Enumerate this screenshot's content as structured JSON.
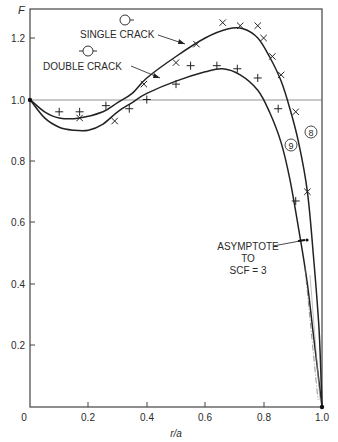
{
  "chart_data": {
    "type": "line",
    "title": "",
    "xlabel": "r/a",
    "ylabel": "F",
    "xlim": [
      0,
      1.0
    ],
    "ylim": [
      0,
      1.3
    ],
    "xticks": [
      "0",
      "0.2",
      "0.4",
      "0.6",
      "0.8",
      "1.0"
    ],
    "yticks": [
      "0",
      "0.2",
      "0.4",
      "0.6",
      "0.8",
      "1.0",
      "1.2"
    ],
    "reference_line": {
      "y": 1.0
    },
    "grid": false,
    "series": [
      {
        "name": "SINGLE CRACK",
        "curve_label": "8",
        "marker": "x",
        "curve": [
          [
            0,
            1.0
          ],
          [
            0.05,
            0.96
          ],
          [
            0.1,
            0.94
          ],
          [
            0.17,
            0.94
          ],
          [
            0.25,
            0.96
          ],
          [
            0.3,
            0.99
          ],
          [
            0.35,
            1.02
          ],
          [
            0.4,
            1.07
          ],
          [
            0.5,
            1.14
          ],
          [
            0.6,
            1.2
          ],
          [
            0.68,
            1.23
          ],
          [
            0.73,
            1.23
          ],
          [
            0.78,
            1.2
          ],
          [
            0.82,
            1.14
          ],
          [
            0.86,
            1.06
          ],
          [
            0.89,
            0.97
          ],
          [
            0.92,
            0.86
          ],
          [
            0.95,
            0.7
          ],
          [
            0.97,
            0.5
          ],
          [
            0.99,
            0.25
          ],
          [
            1.0,
            0.0
          ]
        ],
        "points": [
          [
            0.17,
            0.94
          ],
          [
            0.29,
            0.93
          ],
          [
            0.39,
            1.05
          ],
          [
            0.5,
            1.12
          ],
          [
            0.57,
            1.18
          ],
          [
            0.66,
            1.25
          ],
          [
            0.72,
            1.24
          ],
          [
            0.78,
            1.24
          ],
          [
            0.8,
            1.2
          ],
          [
            0.83,
            1.14
          ],
          [
            0.86,
            1.08
          ],
          [
            0.91,
            0.96
          ],
          [
            0.95,
            0.7
          ]
        ]
      },
      {
        "name": "DOUBLE CRACK",
        "curve_label": "9",
        "marker": "+",
        "curve": [
          [
            0,
            1.0
          ],
          [
            0.05,
            0.94
          ],
          [
            0.1,
            0.91
          ],
          [
            0.15,
            0.9
          ],
          [
            0.2,
            0.9
          ],
          [
            0.25,
            0.92
          ],
          [
            0.3,
            0.96
          ],
          [
            0.35,
            0.99
          ],
          [
            0.4,
            1.02
          ],
          [
            0.5,
            1.06
          ],
          [
            0.6,
            1.09
          ],
          [
            0.66,
            1.1
          ],
          [
            0.72,
            1.08
          ],
          [
            0.78,
            1.03
          ],
          [
            0.82,
            0.96
          ],
          [
            0.86,
            0.86
          ],
          [
            0.89,
            0.74
          ],
          [
            0.92,
            0.58
          ],
          [
            0.95,
            0.4
          ],
          [
            0.97,
            0.24
          ],
          [
            1.0,
            0.0
          ]
        ],
        "points": [
          [
            0.1,
            0.96
          ],
          [
            0.17,
            0.96
          ],
          [
            0.26,
            0.98
          ],
          [
            0.34,
            0.97
          ],
          [
            0.4,
            1.0
          ],
          [
            0.5,
            1.05
          ],
          [
            0.55,
            1.11
          ],
          [
            0.64,
            1.11
          ],
          [
            0.71,
            1.1
          ],
          [
            0.78,
            1.07
          ],
          [
            0.85,
            0.97
          ],
          [
            0.91,
            0.67
          ]
        ]
      }
    ],
    "annotations": [
      {
        "text": "SINGLE CRACK",
        "arrow_to": [
          0.57,
          1.16
        ]
      },
      {
        "text": "DOUBLE CRACK",
        "arrow_to": [
          0.48,
          1.06
        ]
      },
      {
        "text": "ASYMPTOTE TO SCF = 3",
        "arrow_to": [
          0.93,
          0.5
        ]
      },
      {
        "text": "8",
        "circled": true,
        "at": [
          0.945,
          0.9
        ]
      },
      {
        "text": "9",
        "circled": true,
        "at": [
          0.9,
          0.83
        ]
      }
    ]
  },
  "labels": {
    "y_axis": "F",
    "x_axis": "r/a",
    "single_crack": "SINGLE CRACK",
    "double_crack": "DOUBLE CRACK",
    "asymptote_line1": "ASYMPTOTE",
    "asymptote_line2": "TO",
    "asymptote_line3": "SCF = 3",
    "curve8": "8",
    "curve9": "9"
  },
  "ticks": {
    "x": [
      "0",
      "0.2",
      "0.4",
      "0.6",
      "0.8",
      "1.0"
    ],
    "y": [
      "0.2",
      "0.4",
      "0.6",
      "0.8",
      "1.0",
      "1.2"
    ]
  }
}
